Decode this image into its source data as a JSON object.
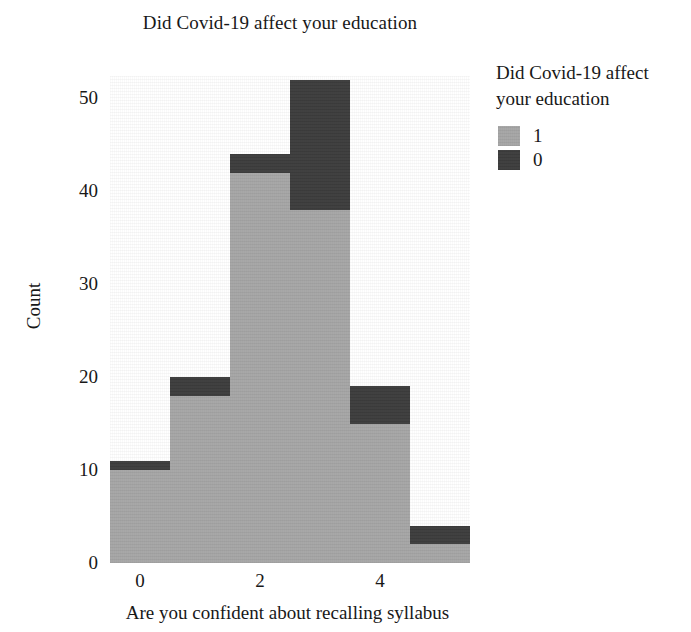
{
  "chart_data": {
    "type": "bar",
    "subtype": "stacked-histogram",
    "title": "Did Covid-19 affect your education",
    "xlabel": "Are you confident about recalling syllabus",
    "ylabel": "Count",
    "grid": false,
    "legend_position": "right",
    "legend": {
      "title": "Did Covid-19 affect your education",
      "entries": [
        {
          "label": "1",
          "color": "#a5a5a5"
        },
        {
          "label": "0",
          "color": "#3a3a3a"
        }
      ]
    },
    "bin_edges": [
      -0.5,
      0.5,
      1.5,
      2.5,
      3.5,
      4.5,
      5.5
    ],
    "bin_centers": [
      0,
      1,
      2,
      3,
      4,
      5
    ],
    "categories": [
      "0",
      "1",
      "2",
      "3",
      "4",
      "5"
    ],
    "series": [
      {
        "name": "1",
        "color": "#a5a5a5",
        "values": [
          10,
          18,
          42,
          38,
          15,
          2
        ]
      },
      {
        "name": "0",
        "color": "#3a3a3a",
        "values": [
          1,
          2,
          2,
          14,
          4,
          2
        ]
      }
    ],
    "totals": [
      11,
      20,
      44,
      52,
      19,
      4
    ],
    "xlim": [
      -0.5,
      5.5
    ],
    "ylim": [
      0,
      52.4
    ],
    "xticks": [
      0,
      2,
      4
    ],
    "xtick_labels": [
      "0",
      "2",
      "4"
    ],
    "yticks": [
      0,
      10,
      20,
      30,
      40,
      50
    ],
    "ytick_labels": [
      "0",
      "10",
      "20",
      "30",
      "40",
      "50"
    ]
  },
  "colors": {
    "background": "#ffffff",
    "text": "#181818",
    "series_light": "#a5a5a5",
    "series_dark": "#3a3a3a"
  }
}
